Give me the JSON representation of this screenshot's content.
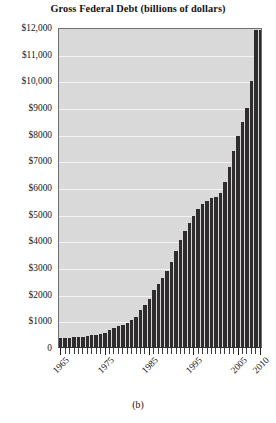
{
  "chart_data": {
    "type": "bar",
    "title": "Gross Federal Debt (billions of dollars)",
    "caption": "(b)",
    "xlabel": "",
    "ylabel": "",
    "ylim": [
      0,
      12000
    ],
    "grid": true,
    "legend": null,
    "y_ticks": [
      {
        "value": 12000,
        "label": "$12,000"
      },
      {
        "value": 11000,
        "label": "$11,000"
      },
      {
        "value": 10000,
        "label": "$10,000"
      },
      {
        "value": 9000,
        "label": "$9000"
      },
      {
        "value": 8000,
        "label": "$8000"
      },
      {
        "value": 7000,
        "label": "$7000"
      },
      {
        "value": 6000,
        "label": "$6000"
      },
      {
        "value": 5000,
        "label": "$5000"
      },
      {
        "value": 4000,
        "label": "$4000"
      },
      {
        "value": 3000,
        "label": "$3000"
      },
      {
        "value": 2000,
        "label": "$2000"
      },
      {
        "value": 1000,
        "label": "$1000"
      },
      {
        "value": 0,
        "label": "0"
      }
    ],
    "x_tick_labels": [
      {
        "year": 1965,
        "label": "1965"
      },
      {
        "year": 1975,
        "label": "1975"
      },
      {
        "year": 1985,
        "label": "1985"
      },
      {
        "year": 1995,
        "label": "1995"
      },
      {
        "year": 2005,
        "label": "2005"
      },
      {
        "year": 2010,
        "label": "2010"
      }
    ],
    "categories": [
      1965,
      1966,
      1967,
      1968,
      1969,
      1970,
      1971,
      1972,
      1973,
      1974,
      1975,
      1976,
      1977,
      1978,
      1979,
      1980,
      1981,
      1982,
      1983,
      1984,
      1985,
      1986,
      1987,
      1988,
      1989,
      1990,
      1991,
      1992,
      1993,
      1994,
      1995,
      1996,
      1997,
      1998,
      1999,
      2000,
      2001,
      2002,
      2003,
      2004,
      2005,
      2006,
      2007,
      2008,
      2009,
      2010
    ],
    "values": [
      322,
      329,
      341,
      369,
      366,
      381,
      408,
      436,
      466,
      484,
      541,
      629,
      706,
      777,
      829,
      909,
      995,
      1137,
      1372,
      1565,
      1817,
      2121,
      2346,
      2601,
      2868,
      3206,
      3598,
      4002,
      4351,
      4643,
      4921,
      5181,
      5369,
      5478,
      5606,
      5628,
      5769,
      6198,
      6760,
      7355,
      7905,
      8451,
      8951,
      9986,
      11876,
      11900
    ]
  }
}
